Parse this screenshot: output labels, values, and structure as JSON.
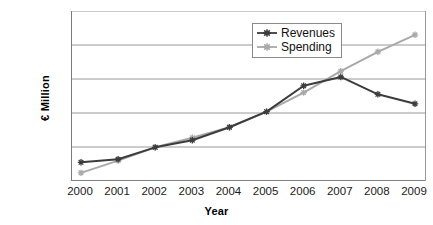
{
  "chart_data": {
    "type": "line",
    "title": "",
    "xlabel": "Year",
    "ylabel": "€ Million",
    "categories": [
      "2000",
      "2001",
      "2002",
      "2003",
      "2004",
      "2005",
      "2006",
      "2007",
      "2008",
      "2009"
    ],
    "ylim": [
      30000,
      80000
    ],
    "ytick_labels": [
      "80,000",
      "70,000",
      "60,000",
      "50,000",
      "40,000",
      "30,000"
    ],
    "ytick_values": [
      80000,
      70000,
      60000,
      50000,
      40000,
      30000
    ],
    "grid": "horizontal",
    "legend_position": "top-right-inside",
    "series": [
      {
        "name": "Revenues",
        "color": "#3c3c3c",
        "marker": "cross-star",
        "values": [
          35500,
          36400,
          39900,
          42000,
          45800,
          50400,
          58000,
          60600,
          55500,
          52700
        ]
      },
      {
        "name": "Spending",
        "color": "#a9a9a9",
        "marker": "cross-star",
        "values": [
          32400,
          36000,
          39900,
          42700,
          45800,
          50400,
          56000,
          62300,
          68000,
          73000
        ]
      }
    ]
  },
  "legend": {
    "entries": [
      {
        "label": "Revenues"
      },
      {
        "label": "Spending"
      }
    ]
  },
  "axes": {
    "x_title": "Year",
    "y_title": "€ Million"
  }
}
